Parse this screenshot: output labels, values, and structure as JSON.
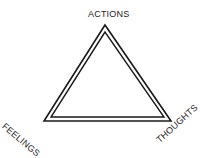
{
  "diagram": {
    "title": "",
    "labels": {
      "top": "ACTIONS",
      "bottom_left": "FEELINGS",
      "bottom_right": "THOUGHTS"
    },
    "shape": "triangle",
    "style": "double-line outline",
    "colors": {
      "stroke": "#1a1a1a",
      "background": "#ffffff"
    }
  }
}
